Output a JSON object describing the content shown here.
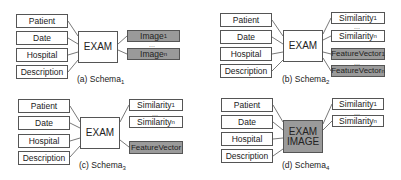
{
  "panels": {
    "a": {
      "caption": "(a) Schema",
      "caption_sub": "1",
      "left": [
        "Patient",
        "Date",
        "Hospital",
        "Description"
      ],
      "center": "EXAM",
      "right": [
        {
          "label": "Image",
          "sub": "1",
          "fill": "gray"
        },
        {
          "label": "Image",
          "sub": "n",
          "fill": "gray"
        }
      ],
      "ellipsis": "..."
    },
    "b": {
      "caption": "(b) Schema",
      "caption_sub": "2",
      "left": [
        "Patient",
        "Date",
        "Hospital",
        "Description"
      ],
      "center": "EXAM",
      "right": [
        {
          "label": "Similarity",
          "sub": "1",
          "fill": "white"
        },
        {
          "label": "Similarity",
          "sub": "n",
          "fill": "white"
        },
        {
          "label": "FeatureVector",
          "sub": "1",
          "fill": "gray"
        },
        {
          "label": "FeatureVector",
          "sub": "n",
          "fill": "gray"
        }
      ],
      "ellipsis": "..."
    },
    "c": {
      "caption": "(c) Schema",
      "caption_sub": "3",
      "left": [
        "Patient",
        "Date",
        "Hospital",
        "Description"
      ],
      "center": "EXAM",
      "right": [
        {
          "label": "Similarity",
          "sub": "1",
          "fill": "white"
        },
        {
          "label": "Similarity",
          "sub": "n",
          "fill": "white"
        },
        {
          "label": "FeatureVector",
          "sub": "",
          "fill": "gray"
        }
      ],
      "ellipsis": "..."
    },
    "d": {
      "caption": "(d) Schema",
      "caption_sub": "4",
      "left": [
        "Patient",
        "Date",
        "Hospital",
        "Description"
      ],
      "center_line1": "EXAM",
      "center_line2": "IMAGE",
      "right": [
        {
          "label": "Similarity",
          "sub": "1",
          "fill": "white"
        },
        {
          "label": "Similarity",
          "sub": "n",
          "fill": "white"
        }
      ],
      "ellipsis": "..."
    }
  },
  "colors": {
    "gray_fill": "#9a9a9a",
    "border": "#555555"
  }
}
